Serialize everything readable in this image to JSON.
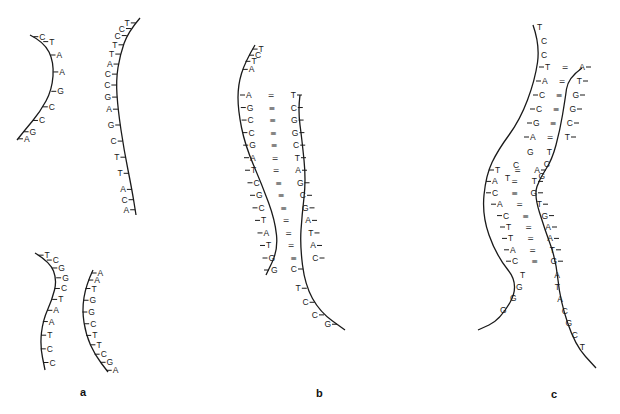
{
  "figure": {
    "panel_labels": [
      "a",
      "b",
      "c"
    ]
  },
  "panels": {
    "a": {
      "label": "a",
      "strands": [
        {
          "id": "a1",
          "bases": [
            "C",
            "T",
            "A",
            "A",
            "G",
            "C",
            "C",
            "G",
            "A"
          ]
        },
        {
          "id": "a2",
          "bases": [
            "T",
            "C",
            "C",
            "T",
            "T",
            "A",
            "C",
            "C",
            "G",
            "A",
            "G",
            "C",
            "T",
            "T",
            "A",
            "C",
            "A"
          ]
        },
        {
          "id": "a3",
          "bases": [
            "T",
            "C",
            "G",
            "G",
            "C",
            "T",
            "A",
            "A",
            "T",
            "C",
            "C"
          ]
        },
        {
          "id": "a4",
          "bases": [
            "A",
            "A",
            "T",
            "G",
            "G",
            "C",
            "T",
            "T",
            "C",
            "G",
            "A"
          ]
        }
      ]
    },
    "b": {
      "label": "b",
      "left_overhang": [
        "T",
        "C",
        "T",
        "A"
      ],
      "pairs": [
        {
          "l": "A",
          "bond": "=",
          "r": "T"
        },
        {
          "l": "G",
          "bond": "≡",
          "r": "C"
        },
        {
          "l": "C",
          "bond": "≡",
          "r": "G"
        },
        {
          "l": "C",
          "bond": "≡",
          "r": "G"
        },
        {
          "l": "G",
          "bond": "≡",
          "r": "C"
        },
        {
          "l": "A",
          "bond": "=",
          "r": "T"
        },
        {
          "l": "T",
          "bond": "=",
          "r": "A"
        },
        {
          "l": "C",
          "bond": "≡",
          "r": "G"
        },
        {
          "l": "G",
          "bond": "≡",
          "r": "C"
        },
        {
          "l": "C",
          "bond": "≡",
          "r": "G"
        },
        {
          "l": "T",
          "bond": "=",
          "r": "A"
        },
        {
          "l": "A",
          "bond": "=",
          "r": "T"
        },
        {
          "l": "T",
          "bond": "=",
          "r": "A"
        },
        {
          "l": "G",
          "bond": "≡",
          "r": "C"
        }
      ],
      "left_tail": [
        "G"
      ],
      "right_overhang": [
        "C",
        "T",
        "C",
        "C",
        "G"
      ]
    },
    "c": {
      "label": "c",
      "left_overhang": [
        "T",
        "C",
        "C"
      ],
      "pairs_top": [
        {
          "l": "T",
          "bond": "=",
          "r": "A"
        },
        {
          "l": "A",
          "bond": "=",
          "r": "T"
        },
        {
          "l": "C",
          "bond": "≡",
          "r": "G"
        },
        {
          "l": "C",
          "bond": "≡",
          "r": "G"
        },
        {
          "l": "G",
          "bond": "≡",
          "r": "C"
        },
        {
          "l": "A",
          "bond": "=",
          "r": "T"
        }
      ],
      "loop_left": [
        "G",
        "C",
        "T"
      ],
      "loop_right": [
        "T",
        "C",
        "G"
      ],
      "pairs_bottom": [
        {
          "l": "T",
          "bond": "=",
          "r": "A"
        },
        {
          "l": "A",
          "bond": "=",
          "r": "T"
        },
        {
          "l": "C",
          "bond": "≡",
          "r": "G"
        },
        {
          "l": "A",
          "bond": "=",
          "r": "T"
        },
        {
          "l": "C",
          "bond": "≡",
          "r": "G"
        },
        {
          "l": "T",
          "bond": "=",
          "r": "A"
        },
        {
          "l": "T",
          "bond": "=",
          "r": "A"
        },
        {
          "l": "A",
          "bond": "=",
          "r": "T"
        },
        {
          "l": "C",
          "bond": "≡",
          "r": "G"
        }
      ],
      "left_tail": [
        "T",
        "G",
        "G",
        "G"
      ],
      "right_tail": [
        "A",
        "T",
        "A",
        "C",
        "G",
        "C",
        "T"
      ]
    }
  }
}
